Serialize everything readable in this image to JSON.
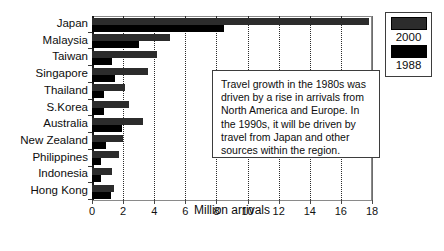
{
  "chart_data": {
    "type": "bar",
    "orientation": "horizontal",
    "title": "",
    "xlabel": "Million arrivals",
    "ylabel": "",
    "xlim": [
      0,
      18
    ],
    "xticks": [
      0,
      2,
      4,
      6,
      8,
      10,
      12,
      14,
      16,
      18
    ],
    "grid": "vertical dotted gridlines at each tick",
    "categories": [
      "Japan",
      "Malaysia",
      "Taiwan",
      "Singapore",
      "Thailand",
      "S.Korea",
      "Australia",
      "New Zealand",
      "Philippines",
      "Indonesia",
      "Hong Kong"
    ],
    "series": [
      {
        "name": "2000",
        "color": "#2c2c2c",
        "values": [
          17.8,
          5.0,
          4.2,
          3.6,
          2.1,
          2.4,
          3.3,
          2.0,
          1.75,
          1.3,
          1.4
        ]
      },
      {
        "name": "1988",
        "color": "#000000",
        "values": [
          8.5,
          3.0,
          1.3,
          1.5,
          0.8,
          0.75,
          1.95,
          0.9,
          0.6,
          0.6,
          1.2
        ]
      }
    ],
    "legend_position": "top-right",
    "annotation": "Travel growth in the 1980s was driven by a rise in arrivals from North America and Europe.  In the 1990s, it will be driven by travel from Japan and other sources within the region."
  },
  "legend": {
    "entries": [
      {
        "label": "2000",
        "color": "#2c2c2c"
      },
      {
        "label": "1988",
        "color": "#000000"
      }
    ]
  },
  "axis": {
    "x_title": "Million arrivals"
  }
}
